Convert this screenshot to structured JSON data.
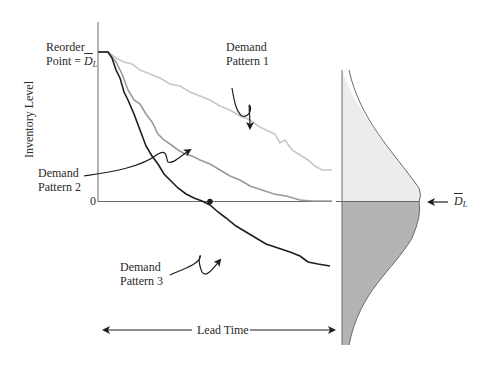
{
  "diagram": {
    "y_axis_label": "Inventory Level",
    "reorder_point": {
      "line1": "Reorder",
      "line2_prefix": "Point = ",
      "symbol": "D",
      "subscript": "L"
    },
    "zero_label": "0",
    "mean_marker": {
      "symbol": "D",
      "subscript": "L"
    },
    "lead_time_label": "Lead Time",
    "patterns": [
      {
        "line1": "Demand",
        "line2": "Pattern 1",
        "color": "#c8c8c8"
      },
      {
        "line1": "Demand",
        "line2": "Pattern 2",
        "color": "#9a9a9a"
      },
      {
        "line1": "Demand",
        "line2": "Pattern 3",
        "color": "#1e1e1e"
      }
    ],
    "distribution": {
      "upper_fill": "#ececec",
      "lower_fill": "#b4b4b4",
      "stroke": "#6a6a6a"
    }
  }
}
